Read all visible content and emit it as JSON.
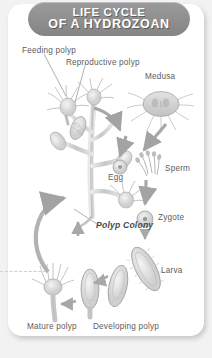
{
  "page": {
    "title_line1": "LIFE CYCLE",
    "title_line2": "OF A HYDROZOAN",
    "background_color": "#f2f2f2",
    "card_color": "#ffffff",
    "banner_color": "#8f8f8f",
    "label_color": "#5d5d5d",
    "art_color": "#9a9a9a"
  },
  "labels": {
    "feeding_polyp": "Feeding polyp",
    "reproductive_polyp": "Reproductive polyp",
    "medusa": "Medusa",
    "egg": "Egg",
    "sperm": "Sperm",
    "zygote": "Zygote",
    "larva": "Larva",
    "polyp_colony": "Polyp Colony",
    "mature_polyp": "Mature polyp",
    "developing_polyp": "Developing polyp"
  },
  "diagram": {
    "type": "biological-life-cycle",
    "subject": "hydrozoan",
    "stages": [
      "Feeding polyp",
      "Reproductive polyp",
      "Medusa",
      "Egg",
      "Sperm",
      "Zygote",
      "Larva",
      "Developing polyp",
      "Mature polyp",
      "Polyp Colony"
    ],
    "flow": [
      "Reproductive polyp -> Medusa",
      "Medusa -> Egg",
      "Medusa -> Sperm",
      "Egg + Sperm -> Zygote",
      "Zygote -> Larva",
      "Larva -> Developing polyp",
      "Developing polyp -> Mature polyp",
      "Mature polyp -> Polyp Colony"
    ]
  }
}
